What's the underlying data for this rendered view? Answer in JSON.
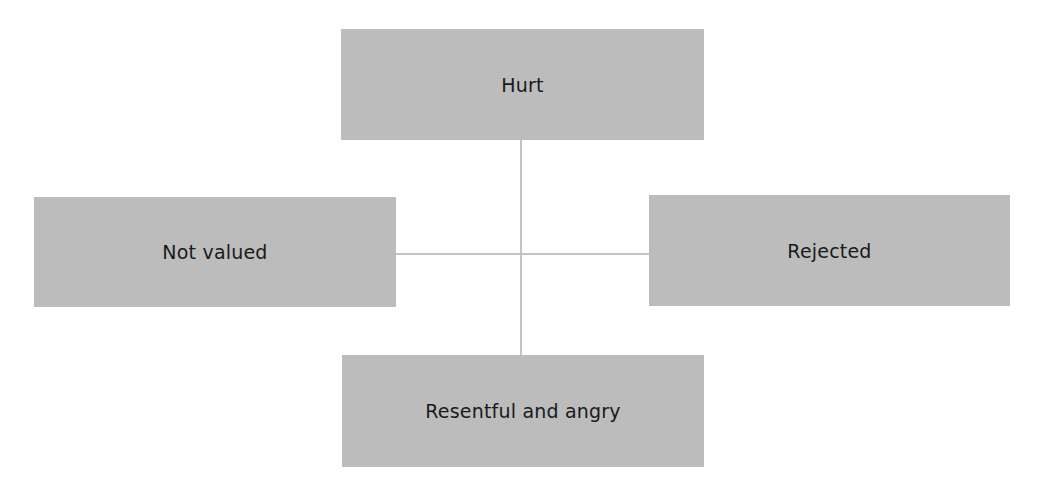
{
  "diagram": {
    "type": "cross-connected boxes",
    "center_point": {
      "x": 521,
      "y": 254
    },
    "colors": {
      "box_fill": "#bcbcbc",
      "connector": "#c3c3c3",
      "text": "#1a1a1a",
      "background": "#ffffff"
    },
    "nodes": {
      "top": {
        "label": "Hurt"
      },
      "left": {
        "label": "Not valued"
      },
      "right": {
        "label": "Rejected"
      },
      "bottom": {
        "label": "Resentful and angry"
      }
    },
    "edges": [
      {
        "from": "top",
        "to": "bottom",
        "orientation": "vertical"
      },
      {
        "from": "left",
        "to": "right",
        "orientation": "horizontal"
      }
    ]
  }
}
